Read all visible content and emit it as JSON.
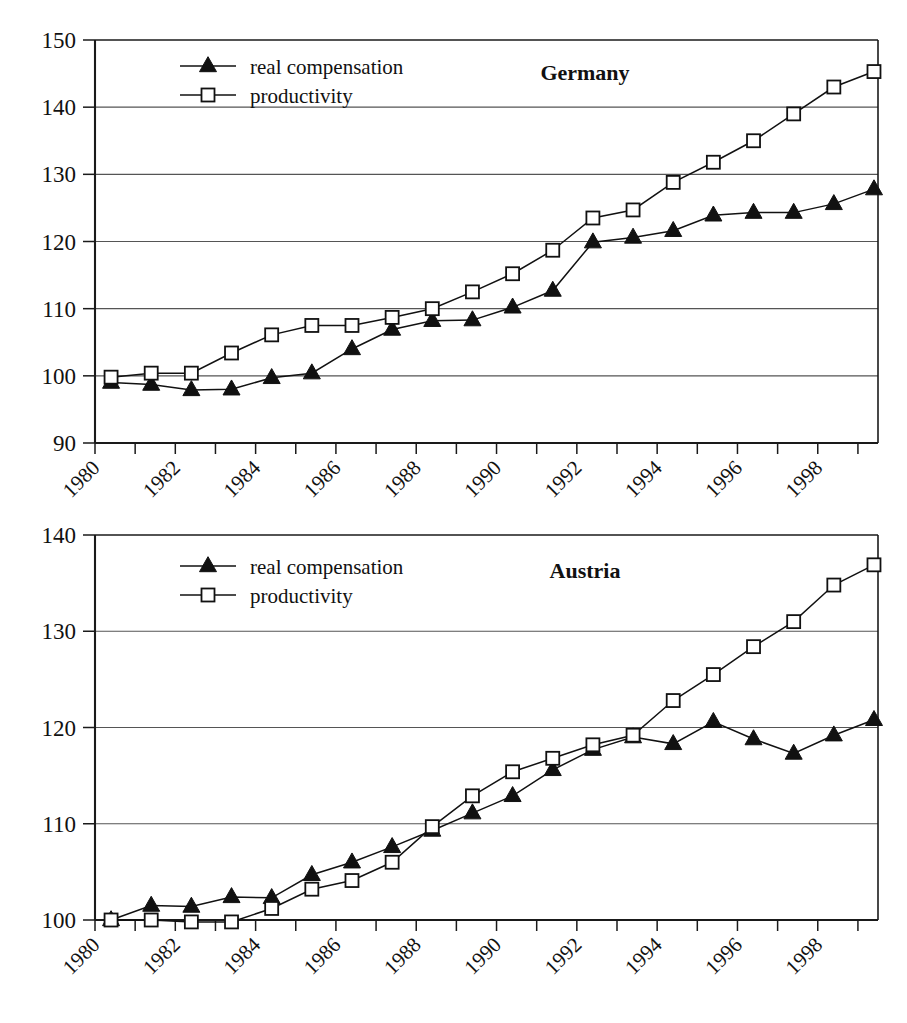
{
  "figure": {
    "panels": [
      "Germany",
      "Austria"
    ]
  },
  "legend": {
    "series1_label": "real compensation",
    "series2_label": "productivity",
    "series1_marker": "filled-triangle",
    "series2_marker": "open-square"
  },
  "chart_data": [
    {
      "type": "line",
      "title": "Germany",
      "xlabel": "",
      "ylabel": "",
      "ylim": [
        90,
        150
      ],
      "yticks": [
        90,
        100,
        110,
        120,
        130,
        140,
        150
      ],
      "xlim": [
        1980,
        1999.5
      ],
      "xticks": [
        1980,
        1981,
        1982,
        1983,
        1984,
        1985,
        1986,
        1987,
        1988,
        1989,
        1990,
        1991,
        1992,
        1993,
        1994,
        1995,
        1996,
        1997,
        1998,
        1999
      ],
      "xticklabels": [
        "1980",
        "",
        "1982",
        "",
        "1984",
        "",
        "1986",
        "",
        "1988",
        "",
        "1990",
        "",
        "1992",
        "",
        "1994",
        "",
        "1996",
        "",
        "1998",
        ""
      ],
      "grid": true,
      "legend_position": "top-left",
      "x": [
        1980.4,
        1981.4,
        1982.4,
        1983.4,
        1984.4,
        1985.4,
        1986.4,
        1987.4,
        1988.4,
        1989.4,
        1990.4,
        1991.4,
        1992.4,
        1993.4,
        1994.4,
        1995.4,
        1996.4,
        1997.4,
        1998.4,
        1999.4
      ],
      "series": [
        {
          "name": "real compensation",
          "marker": "filled-triangle",
          "values": [
            99.0,
            98.7,
            97.9,
            98.0,
            99.7,
            100.4,
            104.0,
            106.9,
            108.2,
            108.3,
            110.2,
            112.7,
            119.9,
            120.6,
            121.6,
            123.9,
            124.3,
            124.3,
            125.6,
            127.8
          ]
        },
        {
          "name": "productivity",
          "marker": "open-square",
          "values": [
            99.8,
            100.4,
            100.4,
            103.4,
            106.1,
            107.5,
            107.5,
            108.7,
            110.0,
            112.5,
            115.2,
            118.7,
            123.5,
            124.7,
            128.8,
            131.8,
            135.0,
            139.0,
            143.0,
            145.3
          ]
        }
      ]
    },
    {
      "type": "line",
      "title": "Austria",
      "xlabel": "",
      "ylabel": "",
      "ylim": [
        100,
        140
      ],
      "yticks": [
        100,
        110,
        120,
        130,
        140
      ],
      "xlim": [
        1980,
        1999.5
      ],
      "xticks": [
        1980,
        1981,
        1982,
        1983,
        1984,
        1985,
        1986,
        1987,
        1988,
        1989,
        1990,
        1991,
        1992,
        1993,
        1994,
        1995,
        1996,
        1997,
        1998,
        1999
      ],
      "xticklabels": [
        "1980",
        "",
        "1982",
        "",
        "1984",
        "",
        "1986",
        "",
        "1988",
        "",
        "1990",
        "",
        "1992",
        "",
        "1994",
        "",
        "1996",
        "",
        "1998",
        ""
      ],
      "grid": true,
      "legend_position": "top-left",
      "x": [
        1980.4,
        1981.4,
        1982.4,
        1983.4,
        1984.4,
        1985.4,
        1986.4,
        1987.4,
        1988.4,
        1989.4,
        1990.4,
        1991.4,
        1992.4,
        1993.4,
        1994.4,
        1995.4,
        1996.4,
        1997.4,
        1998.4,
        1999.4
      ],
      "series": [
        {
          "name": "real compensation",
          "marker": "filled-triangle",
          "values": [
            100.0,
            101.5,
            101.4,
            102.4,
            102.3,
            104.7,
            106.0,
            107.6,
            109.3,
            111.1,
            112.9,
            115.6,
            117.7,
            119.0,
            118.3,
            120.6,
            118.8,
            117.3,
            119.2,
            120.8
          ]
        },
        {
          "name": "productivity",
          "marker": "open-square",
          "values": [
            100.0,
            100.0,
            99.8,
            99.8,
            101.2,
            103.2,
            104.1,
            106.0,
            109.7,
            112.9,
            115.4,
            116.8,
            118.2,
            119.2,
            122.8,
            125.5,
            128.4,
            131.0,
            134.8,
            136.9
          ]
        }
      ]
    }
  ]
}
